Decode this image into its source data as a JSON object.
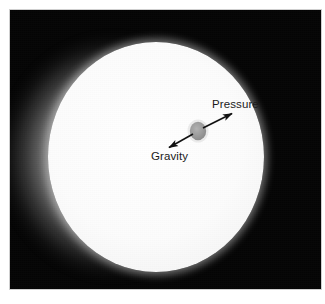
{
  "figure": {
    "kind": "astronomical-photograph-with-annotations",
    "caption": "",
    "plate": {
      "background_color": "#050505",
      "frame_color": "#cfcfcf",
      "x": 9,
      "y": 9,
      "width": 313,
      "height": 281
    },
    "sun_disk": {
      "label": "solar-disk",
      "center_x": 147,
      "center_y": 148,
      "radius_x": 108,
      "radius_y": 115,
      "fill_color": "#fbfbfb",
      "glow_color": "#ffffff"
    },
    "parcel": {
      "label": "gas-parcel",
      "center_x": 198,
      "center_y": 131,
      "radius_x": 8,
      "radius_y": 9,
      "fill_color": "#8f8f8f"
    },
    "arrow": {
      "label": "force-balance-arrow",
      "style": "double-headed",
      "color": "#111111",
      "stroke_width": 1.6,
      "head_length": 11,
      "head_width": 7,
      "start_x": 167,
      "start_y": 149,
      "end_x": 234,
      "end_y": 112
    },
    "labels": [
      {
        "name": "pressure",
        "text": "Pressure",
        "x": 212,
        "y": 98,
        "direction": "outward-up-right",
        "color": "#1a1a1a"
      },
      {
        "name": "gravity",
        "text": "Gravity",
        "x": 151,
        "y": 150,
        "direction": "inward-down-left",
        "color": "#1a1a1a"
      }
    ]
  }
}
